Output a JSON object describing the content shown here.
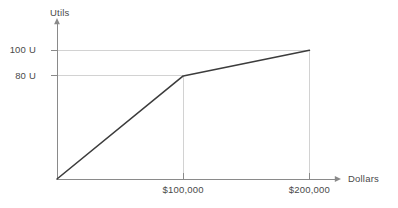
{
  "chart_data": {
    "type": "line",
    "title": "",
    "subtitle": "",
    "xlabel": "Dollars",
    "ylabel": "Utils",
    "x": [
      0,
      100000,
      200000
    ],
    "values": [
      0,
      80,
      100
    ],
    "series": [
      {
        "name": "Utility of wealth",
        "x": [
          0,
          100000,
          200000
        ],
        "values": [
          0,
          80,
          100
        ]
      }
    ],
    "xtick_values": [
      100000,
      200000
    ],
    "xtick_labels": [
      "$100,000",
      "$200,000"
    ],
    "ytick_values": [
      80,
      100
    ],
    "ytick_labels": [
      "80 U",
      "100 U"
    ],
    "xlim": [
      0,
      225000
    ],
    "ylim": [
      0,
      125
    ],
    "grid": "dashed-guides-at-ticks",
    "legend": "none",
    "annotations": [],
    "colors": {
      "line": "#3c3c3c",
      "axis": "#7a7a7a",
      "guide": "#cfcfcf",
      "text": "#4a4a4a",
      "background": "#ffffff"
    }
  },
  "axes": {
    "y_axis_name": "y-axis",
    "x_axis_name": "x-axis",
    "y_label": "Utils",
    "x_label": "Dollars"
  },
  "ticks": {
    "y": [
      {
        "label": "100 U",
        "value": 100
      },
      {
        "label": "80 U",
        "value": 80
      }
    ],
    "x": [
      {
        "label": "$100,000",
        "value": 100000
      },
      {
        "label": "$200,000",
        "value": 200000
      }
    ]
  }
}
